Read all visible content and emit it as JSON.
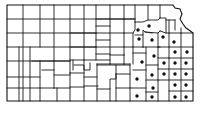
{
  "map": {
    "subject": "Kansas county map",
    "colors": {
      "background": "#ffffff",
      "lines": "#1a1a1a",
      "marker": "#111111"
    },
    "marker_type": "filled-dot",
    "marked_points": [
      [
        149,
        26
      ],
      [
        138,
        30
      ],
      [
        139,
        39
      ],
      [
        152,
        40
      ],
      [
        163,
        37
      ],
      [
        174,
        42
      ],
      [
        175,
        52
      ],
      [
        187,
        52
      ],
      [
        154,
        56
      ],
      [
        142,
        62
      ],
      [
        164,
        63
      ],
      [
        175,
        63
      ],
      [
        186,
        63
      ],
      [
        152,
        75
      ],
      [
        164,
        74
      ],
      [
        175,
        74
      ],
      [
        186,
        74
      ],
      [
        137,
        79
      ],
      [
        153,
        88
      ],
      [
        175,
        85
      ],
      [
        186,
        85
      ],
      [
        137,
        96
      ],
      [
        152,
        97
      ],
      [
        175,
        97
      ],
      [
        186,
        97
      ]
    ],
    "marked_count": 25
  }
}
